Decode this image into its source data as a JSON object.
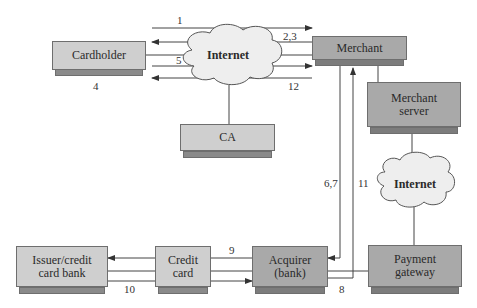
{
  "nodes": {
    "cardholder": "Cardholder",
    "merchant": "Merchant",
    "merchant_server": [
      "Merchant",
      "server"
    ],
    "ca": "CA",
    "issuer": [
      "Issuer/credit",
      "card bank"
    ],
    "credit_card": [
      "Credit",
      "card"
    ],
    "acquirer": [
      "Acquirer",
      "(bank)"
    ],
    "payment_gateway": [
      "Payment",
      "gateway"
    ],
    "internet_top": "Internet",
    "internet_right": "Internet"
  },
  "flow_labels": {
    "l1": "1",
    "l23": "2,3",
    "l4": "4",
    "l5": "5",
    "l12": "12",
    "l67": "6,7",
    "l11": "11",
    "l9": "9",
    "l10": "10",
    "l8": "8"
  },
  "colors": {
    "light_box": "#cfcfcf",
    "dark_box": "#a9a9a9",
    "line": "#444444"
  }
}
